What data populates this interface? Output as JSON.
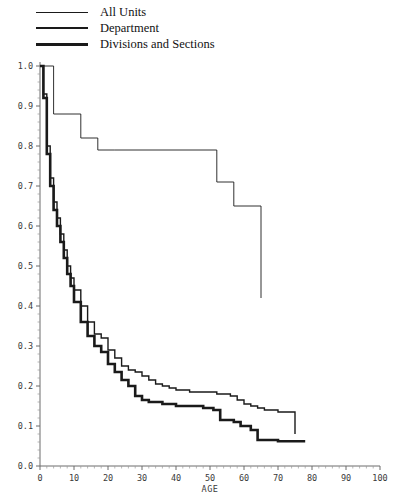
{
  "legend": {
    "items": [
      {
        "label": "All Units",
        "weight": "lw1"
      },
      {
        "label": "Department",
        "weight": "lw2"
      },
      {
        "label": "Divisions and Sections",
        "weight": "lw3"
      }
    ]
  },
  "axes": {
    "x_title": "AGE",
    "x_ticks": [
      "0",
      "10",
      "20",
      "30",
      "40",
      "50",
      "60",
      "70",
      "80",
      "90",
      "100"
    ],
    "y_ticks": [
      "0.0",
      "0.1",
      "0.2",
      "0.3",
      "0.4",
      "0.5",
      "0.6",
      "0.7",
      "0.8",
      "0.9",
      "1.0"
    ]
  },
  "colors": {
    "line": "#1a1a1a",
    "axis": "#6d6d6d",
    "background": "#ffffff"
  },
  "chart_data": {
    "type": "line",
    "title": "",
    "subtitle": "",
    "xlabel": "AGE",
    "ylabel": "",
    "xlim": [
      0,
      100
    ],
    "ylim": [
      0.0,
      1.0
    ],
    "grid": false,
    "legend_position": "top-left",
    "step_style": "post",
    "series": [
      {
        "name": "All Units",
        "x": [
          0,
          4,
          4,
          5,
          12,
          12,
          17,
          17,
          22,
          22,
          52,
          52,
          57,
          57,
          65,
          65
        ],
        "y": [
          1.0,
          1.0,
          0.88,
          0.88,
          0.88,
          0.82,
          0.82,
          0.79,
          0.79,
          0.79,
          0.79,
          0.71,
          0.71,
          0.65,
          0.65,
          0.42
        ]
      },
      {
        "name": "Department",
        "x": [
          0,
          1,
          2,
          3,
          4,
          5,
          6,
          7,
          8,
          9,
          10,
          12,
          14,
          16,
          18,
          20,
          22,
          24,
          26,
          28,
          30,
          32,
          34,
          36,
          38,
          40,
          44,
          48,
          52,
          56,
          58,
          60,
          62,
          64,
          66,
          70,
          75,
          75
        ],
        "y": [
          1.0,
          0.93,
          0.8,
          0.72,
          0.66,
          0.62,
          0.58,
          0.54,
          0.5,
          0.47,
          0.44,
          0.4,
          0.36,
          0.33,
          0.32,
          0.29,
          0.27,
          0.25,
          0.24,
          0.235,
          0.225,
          0.215,
          0.205,
          0.2,
          0.195,
          0.19,
          0.185,
          0.185,
          0.18,
          0.175,
          0.165,
          0.155,
          0.15,
          0.145,
          0.14,
          0.135,
          0.13,
          0.08
        ]
      },
      {
        "name": "Divisions and Sections",
        "x": [
          0,
          1,
          2,
          3,
          4,
          5,
          6,
          7,
          8,
          9,
          10,
          12,
          14,
          16,
          18,
          20,
          22,
          24,
          26,
          28,
          30,
          32,
          36,
          40,
          44,
          48,
          51,
          53,
          57,
          59,
          62,
          64,
          70,
          78
        ],
        "y": [
          1.0,
          0.92,
          0.78,
          0.7,
          0.64,
          0.6,
          0.56,
          0.52,
          0.48,
          0.45,
          0.41,
          0.36,
          0.325,
          0.3,
          0.285,
          0.255,
          0.235,
          0.215,
          0.2,
          0.175,
          0.165,
          0.16,
          0.155,
          0.15,
          0.15,
          0.145,
          0.14,
          0.115,
          0.11,
          0.1,
          0.09,
          0.065,
          0.062,
          0.062
        ]
      }
    ]
  }
}
